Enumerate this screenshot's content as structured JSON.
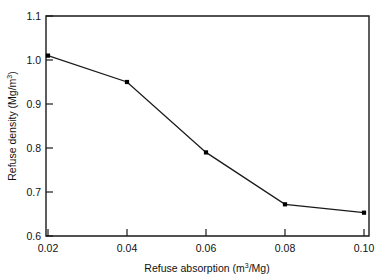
{
  "chart_data": {
    "type": "line",
    "title": "",
    "xlabel": "Refuse absorption (m³/Mg)",
    "ylabel": "Refuse density (Mg/m³)",
    "xlabel_parts": {
      "pre": "Refuse absorption (m",
      "sup": "3",
      "post": "/Mg)"
    },
    "ylabel_parts": {
      "pre": "Refuse density (Mg/m",
      "sup": "3",
      "post": ")"
    },
    "x": [
      0.02,
      0.04,
      0.06,
      0.08,
      0.1
    ],
    "values": [
      1.01,
      0.95,
      0.79,
      0.672,
      0.653
    ],
    "series": [
      {
        "name": "Refuse density",
        "x": [
          0.02,
          0.04,
          0.06,
          0.08,
          0.1
        ],
        "values": [
          1.01,
          0.95,
          0.79,
          0.672,
          0.653
        ]
      }
    ],
    "xlim": [
      0.02,
      0.1
    ],
    "ylim": [
      0.6,
      1.1
    ],
    "xticks": [
      0.02,
      0.04,
      0.06,
      0.08,
      0.1
    ],
    "xtick_labels": [
      "0.02",
      "0.04",
      "0.06",
      "0.08",
      "0.10"
    ],
    "yticks": [
      0.6,
      0.7,
      0.8,
      0.9,
      1.0,
      1.1
    ],
    "ytick_labels": [
      "0.6",
      "0.7",
      "0.8",
      "0.9",
      "1.0",
      "1.1"
    ],
    "grid": false,
    "legend": "none",
    "marker": "square",
    "line_color": "#1a1a1a",
    "marker_color": "#000000",
    "background_color": "#ffffff",
    "axis_color": "#1a1a1a"
  }
}
